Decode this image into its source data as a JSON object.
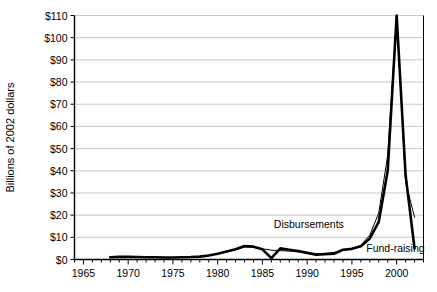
{
  "chart_data": {
    "type": "line",
    "title": "",
    "xlabel": "",
    "ylabel": "Billions of 2002 dollars",
    "xlim": [
      1964,
      2003
    ],
    "ylim": [
      0,
      110
    ],
    "grid": true,
    "legend_position": "inline-annotation",
    "x_tick_labels": [
      "1965",
      "1970",
      "1975",
      "1980",
      "1985",
      "1990",
      "1995",
      "2000"
    ],
    "x_tick_values": [
      1965,
      1970,
      1975,
      1980,
      1985,
      1990,
      1995,
      2000
    ],
    "x_minor_tick_step": 1,
    "y_tick_labels": [
      "$0",
      "$10",
      "$20",
      "$30",
      "$40",
      "$50",
      "$60",
      "$70",
      "$80",
      "$90",
      "$100",
      "$110"
    ],
    "y_tick_values": [
      0,
      10,
      20,
      30,
      40,
      50,
      60,
      70,
      80,
      90,
      100,
      110
    ],
    "x": [
      1968,
      1969,
      1970,
      1971,
      1972,
      1973,
      1974,
      1975,
      1976,
      1977,
      1978,
      1979,
      1980,
      1981,
      1982,
      1983,
      1984,
      1985,
      1986,
      1987,
      1988,
      1989,
      1990,
      1991,
      1992,
      1993,
      1994,
      1995,
      1996,
      1997,
      1998,
      1999,
      2000,
      2001,
      2002
    ],
    "series": [
      {
        "name": "Disbursements",
        "color": "#000000",
        "line_width": 2.6,
        "values": [
          1.0,
          1.2,
          1.2,
          1.1,
          1.0,
          1.0,
          0.9,
          0.9,
          1.0,
          1.1,
          1.3,
          1.8,
          2.6,
          3.6,
          4.6,
          6.1,
          5.8,
          4.6,
          0.6,
          5.0,
          4.4,
          3.8,
          3.0,
          2.2,
          2.4,
          2.6,
          4.4,
          4.8,
          6.0,
          9.5,
          17.0,
          40.0,
          110.0,
          38.0,
          5.0
        ]
      },
      {
        "name": "Fund-raising",
        "color": "#000000",
        "line_width": 1.0,
        "values": [
          0.9,
          1.1,
          1.1,
          1.0,
          0.9,
          0.9,
          0.9,
          0.9,
          1.0,
          1.1,
          1.2,
          1.7,
          2.5,
          3.5,
          4.4,
          5.6,
          5.6,
          4.8,
          4.2,
          4.0,
          3.8,
          3.4,
          2.9,
          2.6,
          2.8,
          3.2,
          4.2,
          4.6,
          6.4,
          11.0,
          21.0,
          47.0,
          110.0,
          35.0,
          19.0
        ]
      }
    ],
    "annotations": [
      {
        "text": "Disbursements",
        "x": 1994.1,
        "y": 14.0,
        "anchor": "end"
      },
      {
        "text": "Fund-raising",
        "x": 1996.6,
        "y": 3.6,
        "anchor": "start"
      }
    ],
    "colors": {
      "gridline": "#c8c8c8",
      "axis": "#000000",
      "background": "#ffffff"
    }
  }
}
